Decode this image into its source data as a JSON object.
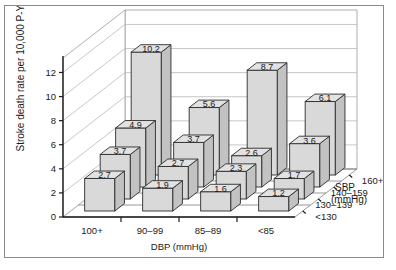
{
  "figure": {
    "frame_border_color": "#8a8a8a",
    "background": "#ffffff",
    "bar_fill": "#d9d9d9"
  },
  "chart_data": {
    "type": "bar",
    "variant": "3d-grouped",
    "title": "",
    "xlabel": "DBP (mmHg)",
    "ylabel": "Stroke death rate per 10,000 P-Y",
    "zlabel": "SBP (mmHg)",
    "categories": [
      "100+",
      "90–99",
      "85–89",
      "<85"
    ],
    "depth_categories": [
      "<130",
      "130–139",
      "140–159",
      "160+"
    ],
    "yticks": [
      0,
      2,
      4,
      6,
      8,
      10,
      12
    ],
    "ylim": [
      0,
      13.2
    ],
    "grid": true,
    "legend_position": "depth-axis",
    "series": [
      {
        "name": "<130",
        "values": [
          2.7,
          1.9,
          1.6,
          1.2
        ]
      },
      {
        "name": "130–139",
        "values": [
          3.7,
          2.7,
          2.3,
          1.7
        ]
      },
      {
        "name": "140–159",
        "values": [
          4.9,
          3.7,
          2.6,
          3.6
        ]
      },
      {
        "name": "160+",
        "values": [
          10.2,
          5.6,
          8.7,
          6.1
        ]
      }
    ]
  },
  "axes": {
    "y_title": "Stroke death rate per 10,000 P-Y",
    "x_title": "DBP (mmHg)",
    "z_title_line1": "SBP",
    "z_title_line2": "(mmHg)",
    "ytick_labels": [
      "0",
      "2",
      "4",
      "6",
      "8",
      "10",
      "12"
    ],
    "xtick_labels": [
      "100+",
      "90–99",
      "85–89",
      "<85"
    ],
    "ztick_labels": [
      "<130",
      "130–139",
      "140–159",
      "160+"
    ]
  }
}
